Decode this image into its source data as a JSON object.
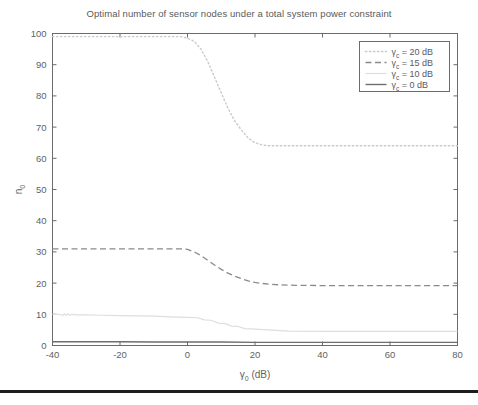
{
  "figure": {
    "title": "Optimal number of sensor nodes under a total system power constraint",
    "background_color": "#ffffff",
    "axis_color": "#6b6b6b",
    "text_color": "#5a5a5a",
    "bottom_rule_color": "#1d1d1d"
  },
  "axes": {
    "x_label_main": "γ",
    "x_label_sub": "0",
    "x_label_unit": " (dB)",
    "x_label_full": "γ0 (dB)",
    "y_label_main": "n",
    "y_label_sub": "0",
    "y_label_full": "n0",
    "x_ticks": [
      "-40",
      "-20",
      "0",
      "20",
      "40",
      "60",
      "80"
    ],
    "y_ticks": [
      "0",
      "10",
      "20",
      "30",
      "40",
      "50",
      "60",
      "70",
      "80",
      "90",
      "100"
    ]
  },
  "legend": {
    "position": "top-right",
    "entries": [
      {
        "label": "γc = 20 dB",
        "sym": "γ",
        "sub": "c",
        "rest": " = 20 dB",
        "style": "dotted",
        "color": "#c9c9c9"
      },
      {
        "label": "γc = 15 dB",
        "sym": "γ",
        "sub": "c",
        "rest": " = 15 dB",
        "style": "dashed",
        "color": "#8a8a8a"
      },
      {
        "label": "γc = 10 dB",
        "sym": "γ",
        "sub": "c",
        "rest": " = 10 dB",
        "style": "solid-light",
        "color": "#dedede"
      },
      {
        "label": "γc = 0 dB",
        "sym": "γ",
        "sub": "c",
        "rest": " = 0 dB",
        "style": "solid",
        "color": "#6e6e6e"
      }
    ]
  },
  "chart_data": {
    "type": "line",
    "title": "Optimal number of sensor nodes under a total system power constraint",
    "xlabel": "γ0 (dB)",
    "ylabel": "n0",
    "xlim": [
      -40,
      80
    ],
    "ylim": [
      0,
      100
    ],
    "xticks": [
      -40,
      -20,
      0,
      20,
      40,
      60,
      80
    ],
    "yticks": [
      0,
      10,
      20,
      30,
      40,
      50,
      60,
      70,
      80,
      90,
      100
    ],
    "grid": false,
    "legend_position": "upper right",
    "series": [
      {
        "name": "γc = 20 dB",
        "style": "dotted",
        "color": "#c9c9c9",
        "x": [
          -40,
          -35,
          -30,
          -25,
          -20,
          -15,
          -10,
          -5,
          -2,
          0,
          2,
          4,
          6,
          8,
          10,
          12,
          14,
          16,
          18,
          20,
          22,
          24,
          28,
          34,
          40,
          50,
          60,
          70,
          80
        ],
        "y": [
          99,
          99,
          99,
          99,
          99,
          99,
          99,
          99,
          99,
          98.5,
          97.5,
          95,
          91,
          86,
          81,
          76,
          72,
          69,
          66.5,
          65,
          64.3,
          64,
          64,
          64,
          64,
          64,
          64,
          64,
          64
        ]
      },
      {
        "name": "γc = 15 dB",
        "style": "dashed",
        "color": "#8a8a8a",
        "x": [
          -40,
          -35,
          -30,
          -25,
          -20,
          -15,
          -10,
          -5,
          -2,
          0,
          2,
          4,
          6,
          8,
          10,
          12,
          14,
          16,
          18,
          20,
          22,
          26,
          32,
          40,
          50,
          60,
          70,
          80
        ],
        "y": [
          31,
          31,
          31,
          31,
          31,
          31,
          31,
          31,
          31,
          30.8,
          30,
          28.8,
          27.3,
          25.8,
          24.4,
          23.2,
          22.2,
          21.4,
          20.7,
          20.2,
          19.9,
          19.5,
          19.3,
          19.2,
          19.2,
          19.2,
          19.2,
          19.2
        ]
      },
      {
        "name": "γc = 10 dB",
        "style": "solid-light",
        "color": "#dedede",
        "x": [
          -40,
          -38,
          -37,
          -36.5,
          -36,
          -35.5,
          -35,
          -34,
          -33,
          -30,
          -25,
          -20,
          -15,
          -10,
          -5,
          0,
          3,
          5,
          7,
          9,
          11,
          13,
          15,
          17,
          19,
          21,
          24,
          30,
          40,
          50,
          60,
          70,
          80
        ],
        "y": [
          10,
          10,
          9.6,
          10.2,
          9.6,
          10.2,
          9.7,
          10,
          9.8,
          9.8,
          9.7,
          9.6,
          9.5,
          9.4,
          9.2,
          9,
          8.9,
          8.2,
          8.1,
          7.2,
          7.1,
          6.2,
          6.1,
          5.4,
          5.3,
          5.2,
          5,
          4.6,
          4.5,
          4.5,
          4.5,
          4.5,
          4.5
        ]
      },
      {
        "name": "γc = 0 dB",
        "style": "solid",
        "color": "#6e6e6e",
        "x": [
          -40,
          -30,
          -20,
          -10,
          0,
          10,
          20,
          30,
          40,
          50,
          60,
          70,
          80
        ],
        "y": [
          1.2,
          1.2,
          1.2,
          1.1,
          1.1,
          1.1,
          1.0,
          1.0,
          1.0,
          1.0,
          1.0,
          1.0,
          1.0
        ]
      }
    ]
  }
}
